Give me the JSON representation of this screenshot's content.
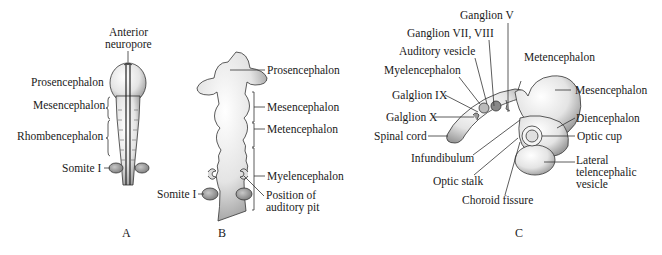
{
  "figure": {
    "panels": [
      {
        "id": "A",
        "letter": "A",
        "labels": {
          "anterior_neuropore_1": "Anterior",
          "anterior_neuropore_2": "neuropore",
          "prosencephalon": "Prosencephalon",
          "mesencephalon": "Mesencephalon",
          "rhombencephalon": "Rhombencephalon",
          "somite": "Somite I"
        }
      },
      {
        "id": "B",
        "letter": "B",
        "labels": {
          "prosencephalon": "Prosencephalon",
          "mesencephalon": "Mesencephalon",
          "metencephalon": "Metencephalon",
          "myelencephalon": "Myelencephalon",
          "auditory_pit_1": "Position of",
          "auditory_pit_2": "auditory pit",
          "somite": "Somite I"
        }
      },
      {
        "id": "C",
        "letter": "C",
        "labels": {
          "ganglion_v": "Ganglion V",
          "ganglion_vii_viii": "Ganglion VII, VIII",
          "auditory_vesicle": "Auditory vesicle",
          "myelencephalon": "Myelencephalon",
          "galglion_ix": "Galglion IX",
          "galglion_x": "Galglion X",
          "spinal_cord": "Spinal cord",
          "infundibulum": "Infundibulum",
          "optic_stalk": "Optic stalk",
          "choroid_fissure": "Choroid fissure",
          "metencephalon": "Metencephalon",
          "mesencephalon": "Mesencephalon",
          "diencephalon": "Diencephalon",
          "optic_cup": "Optic cup",
          "lateral_1": "Lateral",
          "lateral_2": "telencephalic",
          "lateral_3": "vesicle"
        }
      }
    ]
  }
}
